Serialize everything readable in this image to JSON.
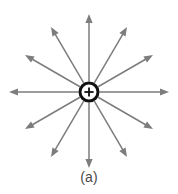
{
  "figure": {
    "caption": "(a)",
    "background_color": "#ffffff",
    "width": 178,
    "height": 194
  },
  "charge": {
    "symbol": "+",
    "polarity": "positive",
    "label": "point-charge",
    "center_x": 89,
    "center_y": 92,
    "radius": 9,
    "ring_color": "#111111",
    "ring_width": 3,
    "symbol_color": "#111111",
    "fill_color": "#ffffff"
  },
  "chart_data": {
    "type": "scatter",
    "subtitle": "",
    "xlabel": "",
    "ylabel": "",
    "grid": false,
    "legend_position": "none",
    "annotations": [
      "(a)"
    ],
    "center": {
      "x": 89,
      "y": 92
    },
    "arrow_color": "#7d7d7d",
    "arrow_count": 12,
    "angle_step_deg": 30,
    "series": [
      {
        "name": "field-vectors",
        "points": [
          {
            "angle_deg": 0,
            "length": 80,
            "tip_x": 169,
            "tip_y": 92,
            "direction": "right"
          },
          {
            "angle_deg": 30,
            "length": 74,
            "tip_x": 153,
            "tip_y": 55,
            "direction": "up-right-shallow"
          },
          {
            "angle_deg": 60,
            "length": 75,
            "tip_x": 127,
            "tip_y": 27,
            "direction": "up-right-steep"
          },
          {
            "angle_deg": 90,
            "length": 78,
            "tip_x": 89,
            "tip_y": 14,
            "direction": "up"
          },
          {
            "angle_deg": 120,
            "length": 75,
            "tip_x": 51,
            "tip_y": 27,
            "direction": "up-left-steep"
          },
          {
            "angle_deg": 150,
            "length": 74,
            "tip_x": 25,
            "tip_y": 55,
            "direction": "up-left-shallow"
          },
          {
            "angle_deg": 180,
            "length": 80,
            "tip_x": 9,
            "tip_y": 92,
            "direction": "left"
          },
          {
            "angle_deg": 210,
            "length": 74,
            "tip_x": 25,
            "tip_y": 129,
            "direction": "down-left-shallow"
          },
          {
            "angle_deg": 240,
            "length": 75,
            "tip_x": 51,
            "tip_y": 157,
            "direction": "down-left-steep"
          },
          {
            "angle_deg": 270,
            "length": 76,
            "tip_x": 89,
            "tip_y": 168,
            "direction": "down"
          },
          {
            "angle_deg": 300,
            "length": 75,
            "tip_x": 127,
            "tip_y": 157,
            "direction": "down-right-steep"
          },
          {
            "angle_deg": 330,
            "length": 74,
            "tip_x": 153,
            "tip_y": 129,
            "direction": "down-right-shallow"
          }
        ]
      }
    ]
  }
}
